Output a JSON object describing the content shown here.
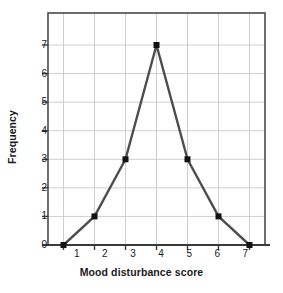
{
  "chart_data": {
    "type": "line",
    "title": "",
    "subtitle": "",
    "xlabel": "Mood disturbance score",
    "ylabel": "Frequency",
    "x": [
      1,
      2,
      3,
      4,
      5,
      6,
      7
    ],
    "values": [
      0,
      1,
      3,
      7,
      3,
      1,
      0
    ],
    "categories": [
      "1",
      "2",
      "3",
      "4",
      "5",
      "6",
      "7"
    ],
    "xticklabels": [
      "1",
      "2",
      "3",
      "4",
      "5",
      "6",
      "7"
    ],
    "yticklabels": [
      "0",
      "1",
      "2",
      "3",
      "4",
      "5",
      "6",
      "7"
    ],
    "yticks": [
      0,
      1,
      2,
      3,
      4,
      5,
      6,
      7
    ],
    "xlim": [
      0.5,
      7.5
    ],
    "ylim": [
      0,
      7.5
    ],
    "grid": "both",
    "legend": "none",
    "marker": "square",
    "line_color": "#4d4d4d",
    "marker_color": "#111111",
    "grid_color": "#cfcfcf",
    "frame_color": "#4a4a4a",
    "axis_color": "#3a3a3a",
    "text_color": "#1b1b1b",
    "background": "#ffffff",
    "annotations": []
  }
}
